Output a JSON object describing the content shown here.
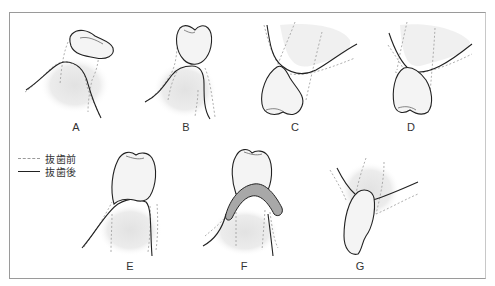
{
  "figure": {
    "panels": [
      {
        "id": "A",
        "label": "A"
      },
      {
        "id": "B",
        "label": "B"
      },
      {
        "id": "C",
        "label": "C"
      },
      {
        "id": "D",
        "label": "D"
      },
      {
        "id": "E",
        "label": "E"
      },
      {
        "id": "F",
        "label": "F"
      },
      {
        "id": "G",
        "label": "G"
      }
    ],
    "legend": {
      "items": [
        {
          "style": "dotted",
          "label": "抜歯前"
        },
        {
          "style": "solid",
          "label": "抜歯後"
        }
      ]
    },
    "colors": {
      "outline": "#222222",
      "dotted": "#9a9a9a",
      "tooth_fill": "#f4f4f4",
      "tissue_shade": "#e6e6e6",
      "band_fill": "#a8a8a8",
      "frame": "#9a9a9a"
    }
  }
}
